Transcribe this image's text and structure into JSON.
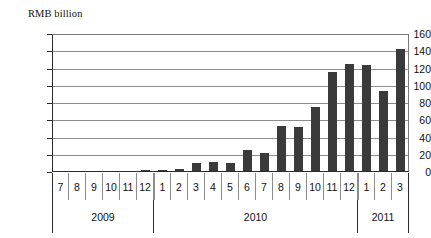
{
  "chart_data": {
    "type": "bar",
    "title": "",
    "subtitle": "",
    "xlabel": "",
    "ylabel": "RMB billion",
    "ylim": [
      0,
      160
    ],
    "yticks": [
      0,
      20,
      40,
      60,
      80,
      100,
      120,
      140,
      160
    ],
    "grid": true,
    "legend": null,
    "bar_color": "#3a3a3a",
    "categories": [
      "7",
      "8",
      "9",
      "10",
      "11",
      "12",
      "1",
      "2",
      "3",
      "4",
      "5",
      "6",
      "7",
      "8",
      "9",
      "10",
      "11",
      "12",
      "1",
      "2",
      "3"
    ],
    "values": [
      1,
      0.6,
      0.8,
      0.6,
      1,
      2.5,
      2.5,
      3.5,
      10.5,
      11.5,
      10.5,
      26,
      21.5,
      53.5,
      52,
      75.5,
      115.5,
      125.5,
      124,
      94.5,
      142.5
    ],
    "group_labels": [
      "2009",
      "2010",
      "2011"
    ],
    "group_spans": [
      6,
      12,
      3
    ]
  },
  "axis": {
    "unit_caption": "RMB billion"
  }
}
